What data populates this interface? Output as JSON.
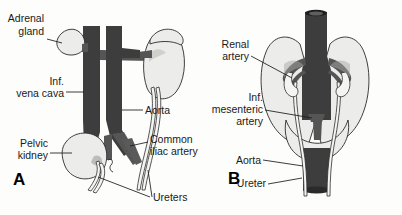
{
  "figure": {
    "background_color": "#fdfdfb",
    "text_color": "#1a1a1a",
    "vessel_color": "#3d3d3d",
    "organ_color": "#ececea",
    "width": 402,
    "height": 215
  },
  "panel_a": {
    "letter": "A",
    "labels": {
      "adrenal_gland_line1": "Adrenal",
      "adrenal_gland_line2": "gland",
      "inf_vena_cava_line1": "Inf.",
      "inf_vena_cava_line2": "vena cava",
      "pelvic_kidney_line1": "Pelvic",
      "pelvic_kidney_line2": "kidney",
      "aorta": "Aorta",
      "common_iliac_artery_line1": "Common",
      "common_iliac_artery_line2": "iliac artery",
      "ureters": "Ureters"
    }
  },
  "panel_b": {
    "letter": "B",
    "labels": {
      "renal_artery_line1": "Renal",
      "renal_artery_line2": "artery",
      "inf_mesenteric_artery_line1": "Inf.",
      "inf_mesenteric_artery_line2": "mesenteric",
      "inf_mesenteric_artery_line3": "artery",
      "aorta": "Aorta",
      "ureter": "Ureter"
    }
  }
}
